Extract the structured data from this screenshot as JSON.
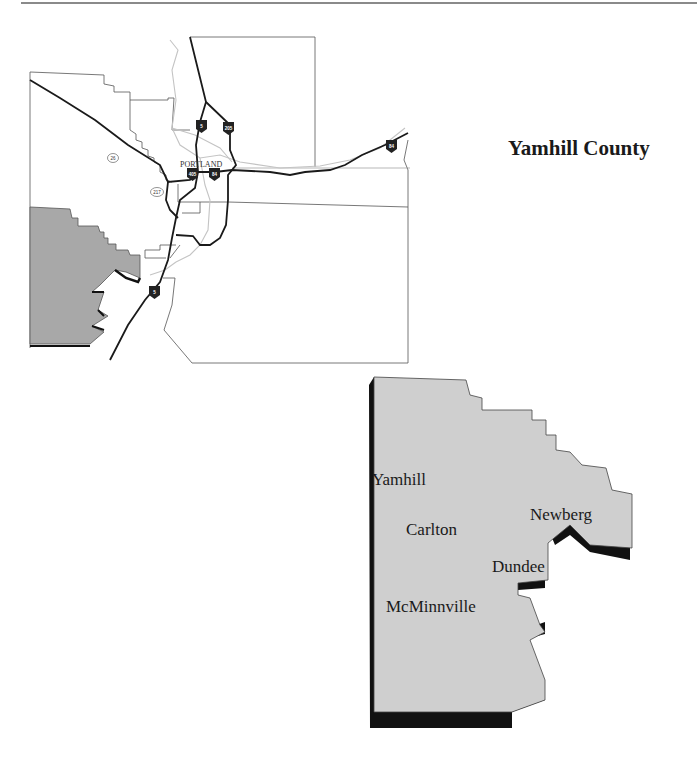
{
  "title": "Yamhill County",
  "region_map": {
    "city_label": "PORTLAND",
    "highway_shields": [
      {
        "label": "5",
        "type": "interstate"
      },
      {
        "label": "205",
        "type": "interstate"
      },
      {
        "label": "405",
        "type": "interstate"
      },
      {
        "label": "84",
        "type": "interstate"
      },
      {
        "label": "84",
        "type": "interstate"
      },
      {
        "label": "5",
        "type": "interstate"
      }
    ],
    "route_markers": [
      {
        "label": "26",
        "type": "us-route"
      },
      {
        "label": "217",
        "type": "state-route"
      }
    ],
    "highlighted_county_color": "#a8a8a8"
  },
  "county_map": {
    "fill_color": "#cfcfcf",
    "shadow_color": "#111111",
    "cities": [
      {
        "name": "Yamhill"
      },
      {
        "name": "Carlton"
      },
      {
        "name": "Newberg"
      },
      {
        "name": "Dundee"
      },
      {
        "name": "McMinnville"
      }
    ]
  }
}
